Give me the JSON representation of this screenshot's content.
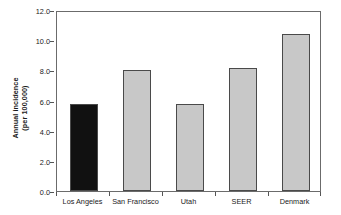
{
  "chart_data": {
    "type": "bar",
    "title": "",
    "subtitle": "",
    "xlabel": "",
    "ylabel": "Annual incidence (per 100,000)",
    "ylabel_line1": "Annual incidence",
    "ylabel_line2": "(per 100,000)",
    "categories": [
      "Los Angeles",
      "San Francisco",
      "Utah",
      "SEER",
      "Denmark"
    ],
    "values": [
      5.8,
      8.0,
      5.75,
      8.15,
      10.4
    ],
    "ylim": [
      0.0,
      12.0
    ],
    "ytick_values": [
      0.0,
      2.0,
      4.0,
      6.0,
      8.0,
      10.0,
      12.0
    ],
    "ytick_labels": [
      "0.0",
      "2.0",
      "4.0",
      "6.0",
      "8.0",
      "10.0",
      "12.0"
    ],
    "grid": false,
    "legend": false,
    "legend_position": "none",
    "bar_colors": [
      "#111111",
      "#c8c8c8",
      "#c8c8c8",
      "#c8c8c8",
      "#c8c8c8"
    ],
    "bar_edge_color": "#4a4a4a",
    "highlight_category": "Los Angeles",
    "frame_color": "#6b6b6b",
    "text_color": "#1a1a1a",
    "background": "#ffffff"
  }
}
